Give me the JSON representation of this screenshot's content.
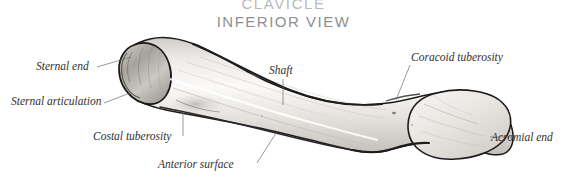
{
  "figure": {
    "title": "CLAVICLE",
    "subtitle": "INFERIOR VIEW",
    "title_color": "#b9b9bb",
    "subtitle_color": "#8e8e91",
    "background_color": "#ffffff",
    "bone_outline_color": "#1d1c1b",
    "bone_fill_color": "#f2f1ef",
    "bone_shade_color": "#b7b4b0",
    "leader_line_color": "#6f6d6b",
    "label_color": "#33312f"
  },
  "labels": [
    {
      "id": "sternal-end",
      "text": "Sternal end"
    },
    {
      "id": "sternal-articulation",
      "text": "Sternal articulation"
    },
    {
      "id": "costal-tuberosity",
      "text": "Costal tuberosity"
    },
    {
      "id": "anterior-surface",
      "text": "Anterior surface"
    },
    {
      "id": "shaft",
      "text": "Shaft"
    },
    {
      "id": "coracoid-tuberosity",
      "text": "Coracoid tuberosity"
    },
    {
      "id": "acromial-end",
      "text": "Acromial end"
    }
  ]
}
